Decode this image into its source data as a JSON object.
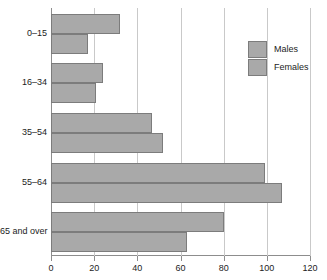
{
  "chart_data": {
    "type": "bar",
    "orientation": "horizontal",
    "title": "",
    "xlabel": "",
    "ylabel": "",
    "categories": [
      "0–15",
      "16–34",
      "35–54",
      "55–64",
      "65 and over"
    ],
    "series": [
      {
        "name": "Males",
        "values": [
          32,
          24,
          47,
          99,
          80
        ]
      },
      {
        "name": "Females",
        "values": [
          17,
          21,
          52,
          107,
          63
        ]
      }
    ],
    "xlim": [
      0,
      120
    ],
    "xticks": [
      0,
      20,
      40,
      60,
      80,
      100,
      120
    ],
    "xticklabels": [
      "0",
      "20",
      "40",
      "60",
      "80",
      "100",
      "120"
    ],
    "grid": true,
    "legend_position": "upper right",
    "bar_color": "#a9a9a9",
    "bar_border_color": "#7c7c7c",
    "grid_color": "#c9c9c9",
    "axis_color": "#8d8d8d"
  }
}
